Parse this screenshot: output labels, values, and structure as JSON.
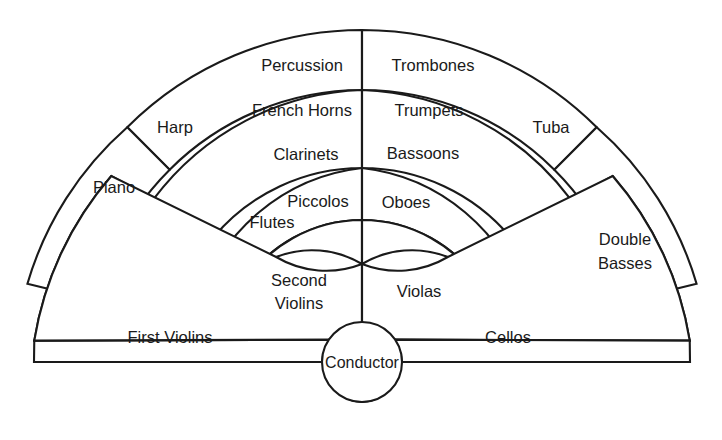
{
  "diagram": {
    "stroke_color": "#1a1a1a",
    "fill_color": "#ffffff",
    "background": "#ffffff",
    "center": {
      "x": 362,
      "y": 362
    },
    "ring_radii": [
      142,
      194,
      272,
      332
    ],
    "conductor_radius": 40
  },
  "sections": {
    "conductor": {
      "label": "Conductor"
    },
    "ring_outer": {
      "percussion": {
        "label": "Percussion"
      },
      "trombones": {
        "label": "Trombones"
      },
      "harp": {
        "label": "Harp"
      },
      "tuba": {
        "label": "Tuba"
      }
    },
    "ring_third": {
      "french_horns": {
        "label": "French Horns"
      },
      "trumpets": {
        "label": "Trumpets"
      },
      "piano": {
        "label": "Piano"
      },
      "double_basses": {
        "label": "Double\nBasses",
        "line1": "Double",
        "line2": "Basses"
      }
    },
    "ring_second": {
      "clarinets": {
        "label": "Clarinets"
      },
      "bassoons": {
        "label": "Bassoons"
      }
    },
    "ring_inner": {
      "piccolos": {
        "label": "Piccolos"
      },
      "oboes": {
        "label": "Oboes"
      },
      "flutes": {
        "label": "Flutes"
      }
    },
    "ring_front": {
      "first_violins": {
        "label": "First Violins"
      },
      "second_violins": {
        "label": "Second\nViolins",
        "line1": "Second",
        "line2": "Violins"
      },
      "violas": {
        "label": "Violas"
      },
      "cellos": {
        "label": "Cellos"
      }
    }
  }
}
